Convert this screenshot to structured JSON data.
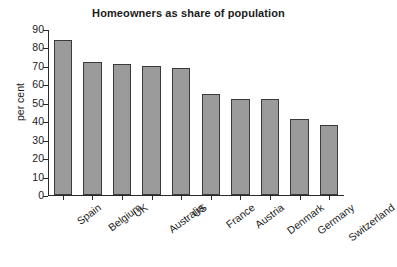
{
  "chart_data": {
    "type": "bar",
    "title": "Homeowners as share of population",
    "xlabel": "",
    "ylabel": "per cent",
    "ylim": [
      0,
      90
    ],
    "yticks": [
      0,
      10,
      20,
      30,
      40,
      50,
      60,
      70,
      80,
      90
    ],
    "grid": false,
    "legend": null,
    "categories": [
      "Spain",
      "Belgium",
      "UK",
      "Australia",
      "US",
      "France",
      "Austria",
      "Denmark",
      "Germany",
      "Switzerland"
    ],
    "values": [
      84,
      72,
      71,
      70,
      69,
      55,
      52,
      52,
      41,
      38
    ],
    "bar_color": "#9b9b9b",
    "bar_border_color": "#3a3a3a",
    "axis_color": "#2a2a2a",
    "background": "#ffffff"
  }
}
